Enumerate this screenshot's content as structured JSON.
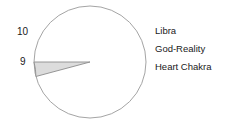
{
  "chart_data": {
    "type": "pie",
    "title": "",
    "subtitle": "",
    "xlabel": "",
    "ylabel": "",
    "grid": false,
    "legend_position": "right",
    "center": {
      "x": 90,
      "y": 62
    },
    "radius": 56,
    "circle_stroke": "#9a9a9a",
    "wedge_fill": "#dcdcdc",
    "wedge_stroke": "#8c8c8c",
    "background": "#ffffff",
    "text_color": "#1a1a1a",
    "categories": [
      "9",
      "10"
    ],
    "values": [
      9,
      10
    ],
    "point_labels": [
      {
        "text": "10",
        "value": 10,
        "angle_deg": 195
      },
      {
        "text": "9",
        "value": 9,
        "angle_deg": 180
      }
    ],
    "highlighted_wedge": {
      "start_angle_deg": 180,
      "end_angle_deg": 195,
      "sweep_deg": 15,
      "start_label": "9",
      "end_label": "10"
    },
    "annotations": [
      "Libra",
      "God-Reality",
      "Heart Chakra"
    ]
  },
  "chart": {
    "value_labels": {
      "upper": "10",
      "lower": "9"
    }
  },
  "legend": {
    "items": [
      {
        "label": "Libra"
      },
      {
        "label": "God-Reality"
      },
      {
        "label": "Heart Chakra"
      }
    ]
  }
}
